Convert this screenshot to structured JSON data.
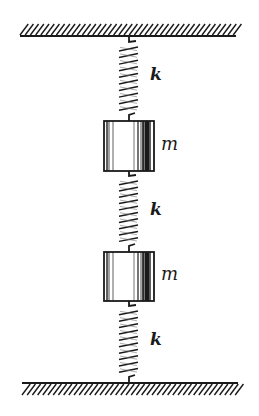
{
  "figure": {
    "width": 259,
    "height": 416,
    "colors": {
      "ink": "#1a1a1a",
      "background": "#ffffff"
    }
  },
  "walls": [
    {
      "id": "top",
      "x1": 20,
      "x2": 236,
      "line_y": 36,
      "hatch_top": 24,
      "hatch_bottom": 35
    },
    {
      "id": "bottom",
      "x1": 22,
      "x2": 238,
      "line_y": 383,
      "hatch_top": 384,
      "hatch_bottom": 395
    }
  ],
  "springs": [
    {
      "id": "spring-1",
      "label": "k",
      "top_y": 37,
      "bottom_y": 121,
      "label_x": 150,
      "label_y": 66
    },
    {
      "id": "spring-2",
      "label": "k",
      "top_y": 171,
      "bottom_y": 252,
      "label_x": 150,
      "label_y": 201
    },
    {
      "id": "spring-3",
      "label": "k",
      "top_y": 301,
      "bottom_y": 383,
      "label_x": 150,
      "label_y": 331
    }
  ],
  "masses": [
    {
      "id": "mass-1",
      "label": "m",
      "x": 104,
      "y": 121,
      "w": 50,
      "h": 50,
      "label_x": 161,
      "label_y": 135
    },
    {
      "id": "mass-2",
      "label": "m",
      "x": 104,
      "y": 252,
      "w": 50,
      "h": 49,
      "label_x": 161,
      "label_y": 265
    }
  ],
  "labels": {
    "spring_constant": "k",
    "mass": "m"
  }
}
